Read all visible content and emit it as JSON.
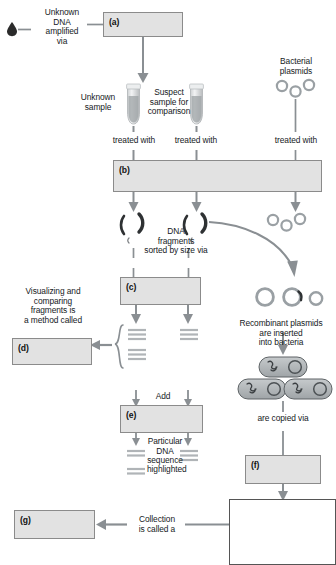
{
  "diagram": {
    "title_cut_off": "",
    "boxes": [
      {
        "id": "a",
        "tag": "(a)",
        "x": 103,
        "y": 12,
        "w": 80,
        "h": 25
      },
      {
        "id": "b",
        "tag": "(b)",
        "x": 113,
        "y": 160,
        "w": 209,
        "h": 32
      },
      {
        "id": "c",
        "tag": "(c)",
        "x": 120,
        "y": 277,
        "w": 81,
        "h": 28
      },
      {
        "id": "d",
        "tag": "(d)",
        "x": 12,
        "y": 338,
        "w": 80,
        "h": 27
      },
      {
        "id": "e",
        "tag": "(e)",
        "x": 120,
        "y": 405,
        "w": 83,
        "h": 28
      },
      {
        "id": "f",
        "tag": "(f)",
        "x": 245,
        "y": 455,
        "w": 76,
        "h": 29
      },
      {
        "id": "g",
        "tag": "(g)",
        "x": 14,
        "y": 510,
        "w": 81,
        "h": 29
      }
    ],
    "labels": {
      "unknown_dna_amplified_via": "Unknown\nDNA\namplified\nvia",
      "unknown_sample": "Unknown\nsample",
      "suspect_sample": "Suspect\nsample for\ncomparison",
      "bacterial_plasmids": "Bacterial\nplasmids",
      "treated_with_left": "treated with",
      "treated_with_mid": "treated with",
      "treated_with_right": "treated with",
      "dna_fragments_sorted": "DNA\nfragments\nsorted by size via",
      "visualizing_comparing": "Visualizing and\ncomparing\nfragments is\na method called",
      "recombinant_plasmids": "Recombinant plasmids\nare inserted\ninto bacteria",
      "add": "Add",
      "particular_dna_sequence": "Particular\nDNA\nsequence",
      "highlighted": "highlighted",
      "are_copied_via": "are copied via",
      "collection_is_called_a": "Collection\nis called a"
    },
    "colors": {
      "box_fill": "#e2e2e2",
      "box_border": "#8b8b8b",
      "arrow": "#8a8f93",
      "text": "#15191c",
      "plasmid": "#9aa0a4",
      "cell_fill": "#b8bcbe",
      "tube_fill": "#c9ccce",
      "band": "#b4b8bb",
      "drop": "#2b2b2b"
    },
    "icons": {
      "blood_drop": "blood-drop-icon",
      "tube": "microcentrifuge-tube-icon",
      "plasmid_ring": "plasmid-ring-icon",
      "dna_fragment": "dna-fragment-icon",
      "gel_band": "gel-band-icon",
      "bacterium": "bacterium-cell-icon",
      "brace": "curly-brace-icon"
    }
  }
}
